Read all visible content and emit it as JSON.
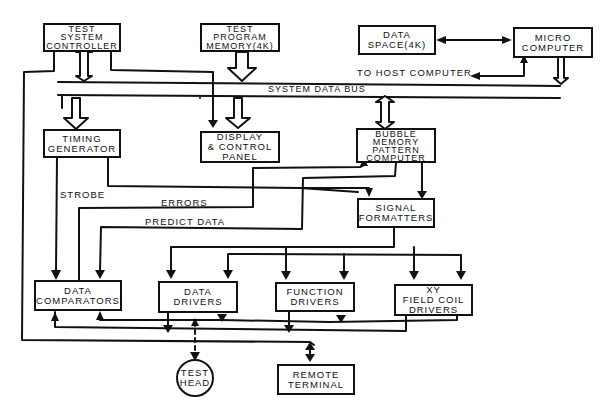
{
  "diagram": {
    "blocks": {
      "test_system_controller": "TEST\nSYSTEM\nCONTROLLER",
      "test_program_memory": "TEST\nPROGRAM\nMEMORY(4K)",
      "data_space": "DATA\nSPACE(4K)",
      "micro_computer": "MICRO\nCOMPUTER",
      "timing_generator": "TIMING\nGENERATOR",
      "display_control_panel": "DISPLAY\n& CONTROL\nPANEL",
      "bubble_memory_pattern_computer": "BUBBLE\nMEMORY\nPATTERN\nCOMPUTER",
      "signal_formatters": "SIGNAL\nFORMATTERS",
      "data_comparators": "DATA\nCOMPARATORS",
      "data_drivers": "DATA\nDRIVERS",
      "function_drivers": "FUNCTION\nDRIVERS",
      "xy_field_coil_drivers": "XY\nFIELD COIL\nDRIVERS",
      "test_head": "TEST\nHEAD",
      "remote_terminal": "REMOTE\nTERMINAL"
    },
    "labels": {
      "system_data_bus": "SYSTEM DATA BUS",
      "to_host_computer": "TO HOST COMPUTER",
      "strobe": "STROBE",
      "errors": "ERRORS",
      "predict_data": "PREDICT DATA"
    }
  }
}
